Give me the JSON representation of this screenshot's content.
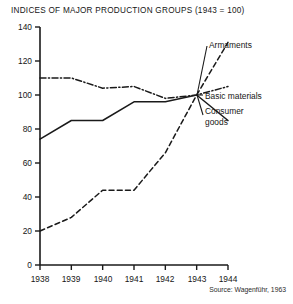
{
  "figure": {
    "title": "INDICES OF MAJOR PRODUCTION GROUPS (1943 = 100)",
    "source": "Source: Wagenführ, 1963",
    "background": "#ffffff",
    "ink": "#1a1a1a"
  },
  "axes": {
    "y_ticks": [
      "140",
      "120",
      "100",
      "80",
      "60",
      "40",
      "20",
      "0"
    ],
    "x_ticks": [
      "1938",
      "1939",
      "1940",
      "1941",
      "1942",
      "1943",
      "1944"
    ]
  },
  "labels": {
    "armaments": "Armaments",
    "basic_materials": "Basic materials",
    "consumer_goods_line1": "Consumer",
    "consumer_goods_line2": "goods"
  },
  "chart_data": {
    "type": "line",
    "title": "INDICES OF MAJOR PRODUCTION GROUPS (1943 = 100)",
    "xlabel": "",
    "ylabel": "",
    "x": [
      1938,
      1939,
      1940,
      1941,
      1942,
      1943,
      1944
    ],
    "xlim": [
      1938,
      1944
    ],
    "ylim": [
      0,
      140
    ],
    "ytick_values": [
      0,
      20,
      40,
      60,
      80,
      100,
      120,
      140
    ],
    "grid": false,
    "legend": "inline-annotations-right",
    "series": [
      {
        "name": "Armaments",
        "style": "dashed",
        "color": "#1a1a1a",
        "values": [
          20,
          28,
          44,
          44,
          66,
          100,
          131
        ]
      },
      {
        "name": "Basic materials",
        "style": "dash-dot",
        "color": "#1a1a1a",
        "values": [
          110,
          110,
          104,
          105,
          98,
          100,
          105
        ]
      },
      {
        "name": "Consumer goods",
        "style": "solid",
        "color": "#1a1a1a",
        "values": [
          74,
          85,
          85,
          96,
          96,
          100,
          85
        ]
      }
    ],
    "annotations": [
      "Source: Wagenführ, 1963"
    ]
  }
}
